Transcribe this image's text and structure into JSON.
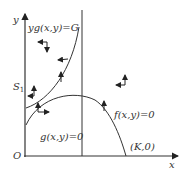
{
  "diagram": {
    "axes": {
      "x_label": "x",
      "y_label": "y",
      "origin_label": "O"
    },
    "curves": [
      {
        "name": "yg",
        "label": "yg(x,y)=G"
      },
      {
        "name": "f",
        "label": "f(x,y)=0"
      },
      {
        "name": "g",
        "label": "g(x,y)=0"
      }
    ],
    "points": {
      "s1": "S",
      "s1_sub": "1",
      "k": "(K,0)"
    },
    "colors": {
      "line": "#333333",
      "background": "#ffffff"
    }
  }
}
